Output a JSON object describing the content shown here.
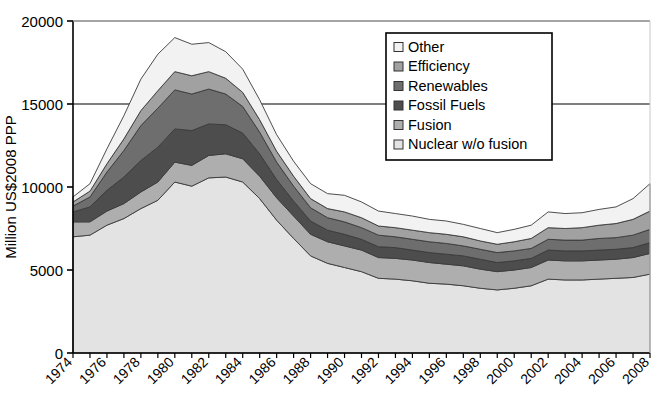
{
  "chart_data": {
    "type": "area",
    "stacked": true,
    "title": "",
    "xlabel": "",
    "ylabel": "Million US$2008 PPP",
    "ylim": [
      0,
      20000
    ],
    "ytick_values": [
      0,
      5000,
      10000,
      15000,
      20000
    ],
    "ytick_labels": [
      "0",
      "5000",
      "10000",
      "15000",
      "20000"
    ],
    "grid": true,
    "gridlines_at": [
      15000,
      20000
    ],
    "legend_position": "top-right-inside",
    "x": [
      1974,
      1975,
      1976,
      1977,
      1978,
      1979,
      1980,
      1981,
      1982,
      1983,
      1984,
      1985,
      1986,
      1987,
      1988,
      1989,
      1990,
      1991,
      1992,
      1993,
      1994,
      1995,
      1996,
      1997,
      1998,
      1999,
      2000,
      2001,
      2002,
      2003,
      2004,
      2005,
      2006,
      2007,
      2008
    ],
    "xtick_labels": [
      "1974",
      "1976",
      "1978",
      "1980",
      "1982",
      "1984",
      "1986",
      "1988",
      "1990",
      "1992",
      "1994",
      "1996",
      "1998",
      "2000",
      "2002",
      "2004",
      "2006",
      "2008"
    ],
    "xlim": [
      1974,
      2008
    ],
    "series": [
      {
        "name": "Nuclear w/o fusion",
        "color": "#e3e3e3",
        "order": 1,
        "values": [
          7000,
          7100,
          7700,
          8100,
          8700,
          9200,
          10300,
          10050,
          10550,
          10600,
          10300,
          9300,
          8000,
          6900,
          5850,
          5400,
          5150,
          4900,
          4500,
          4450,
          4350,
          4200,
          4150,
          4050,
          3900,
          3800,
          3900,
          4050,
          4450,
          4400,
          4400,
          4450,
          4500,
          4550,
          4750
        ]
      },
      {
        "name": "Fusion",
        "color": "#aeaeae",
        "order": 2,
        "values": [
          900,
          800,
          850,
          900,
          1000,
          1100,
          1200,
          1250,
          1350,
          1400,
          1400,
          1350,
          1350,
          1350,
          1300,
          1300,
          1300,
          1300,
          1250,
          1250,
          1250,
          1250,
          1200,
          1200,
          1150,
          1100,
          1100,
          1100,
          1150,
          1150,
          1150,
          1150,
          1150,
          1200,
          1250
        ]
      },
      {
        "name": "Fossil Fuels",
        "color": "#4d4d4d",
        "order": 3,
        "values": [
          600,
          900,
          1250,
          1600,
          1900,
          2100,
          2000,
          2100,
          1900,
          1750,
          1550,
          1350,
          1100,
          900,
          800,
          700,
          700,
          650,
          650,
          650,
          600,
          600,
          600,
          600,
          600,
          550,
          550,
          550,
          600,
          600,
          600,
          600,
          600,
          600,
          650
        ]
      },
      {
        "name": "Renewables",
        "color": "#6e6e6e",
        "order": 4,
        "values": [
          350,
          600,
          1100,
          1600,
          2100,
          2350,
          2350,
          2200,
          2100,
          1850,
          1600,
          1300,
          1050,
          900,
          800,
          750,
          750,
          700,
          700,
          650,
          650,
          650,
          650,
          600,
          600,
          600,
          600,
          600,
          650,
          650,
          650,
          700,
          700,
          750,
          800
        ]
      },
      {
        "name": "Efficiency",
        "color": "#a1a1a1",
        "order": 5,
        "values": [
          250,
          350,
          500,
          700,
          900,
          1050,
          1100,
          1100,
          1050,
          950,
          850,
          750,
          650,
          600,
          550,
          550,
          600,
          600,
          550,
          550,
          550,
          550,
          550,
          550,
          500,
          500,
          550,
          600,
          700,
          700,
          750,
          800,
          850,
          950,
          1100
        ]
      },
      {
        "name": "Other",
        "color": "#f2f2f2",
        "order": 6,
        "values": [
          300,
          450,
          900,
          1400,
          1900,
          2200,
          2050,
          1900,
          1750,
          1600,
          1400,
          1200,
          1000,
          900,
          900,
          900,
          1000,
          950,
          900,
          850,
          850,
          800,
          800,
          750,
          750,
          700,
          750,
          800,
          950,
          900,
          900,
          950,
          1000,
          1250,
          1650
        ]
      }
    ],
    "legend_entries": [
      {
        "label": "Other",
        "color": "#f2f2f2"
      },
      {
        "label": "Efficiency",
        "color": "#a1a1a1"
      },
      {
        "label": "Renewables",
        "color": "#6e6e6e"
      },
      {
        "label": "Fossil Fuels",
        "color": "#4d4d4d"
      },
      {
        "label": "Fusion",
        "color": "#aeaeae"
      },
      {
        "label": "Nuclear w/o fusion",
        "color": "#e3e3e3"
      }
    ],
    "plot_bg": "#ffffff",
    "axis_color": "#000000"
  }
}
